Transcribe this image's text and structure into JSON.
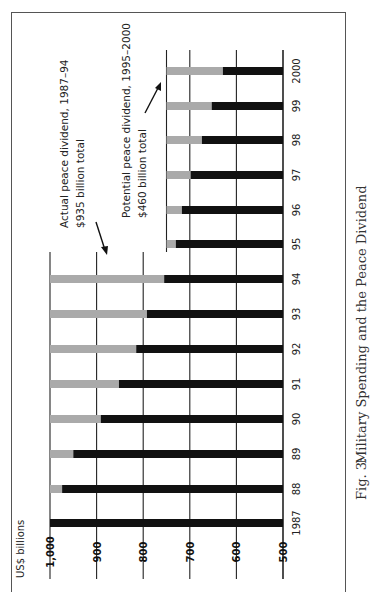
{
  "chart_data": {
    "type": "bar",
    "orientation": "rotated 90 degrees counter-clockwise (page printed sideways)",
    "title": "Military Spending and the Peace Dividend",
    "caption_label": "Fig. 3:",
    "ylabel": "US$ billions",
    "xlabel": "",
    "ylim": [
      500,
      1000
    ],
    "y_ticks": [
      "1,000",
      "900",
      "800",
      "700",
      "600",
      "500"
    ],
    "y_tick_values": [
      1000,
      900,
      800,
      700,
      600,
      500
    ],
    "categories": [
      "1987",
      "88",
      "89",
      "90",
      "91",
      "92",
      "93",
      "94",
      "95",
      "96",
      "97",
      "98",
      "99",
      "2000"
    ],
    "series": [
      {
        "name": "Military spending",
        "color": "#111111",
        "values": [
          1000,
          974,
          950,
          891,
          852,
          815,
          792,
          755,
          730,
          717,
          698,
          674,
          653,
          629
        ]
      },
      {
        "name": "Peace dividend",
        "color": "#aaaaaa",
        "reference_levels": [
          1000,
          1000,
          1000,
          1000,
          1000,
          1000,
          1000,
          1000,
          750,
          750,
          750,
          750,
          750,
          750
        ],
        "values": [
          0,
          26,
          50,
          109,
          148,
          185,
          208,
          245,
          20,
          33,
          52,
          76,
          97,
          121
        ]
      }
    ],
    "annotations": [
      {
        "text_line1": "Actual peace dividend, 1987–94",
        "text_line2": "$935 billion total"
      },
      {
        "text_line1": "Potential peace dividend, 1995–2000",
        "text_line2": "$460 billion total"
      }
    ],
    "grid": true,
    "legend": "none"
  }
}
